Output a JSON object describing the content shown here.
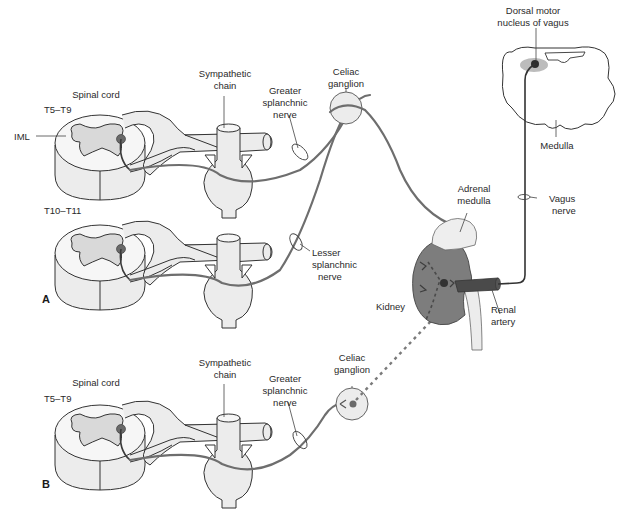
{
  "figure": {
    "panels": [
      {
        "id": "A",
        "label": "A",
        "spinal_segments": [
          {
            "title": "Spinal cord",
            "level": "T5–T9",
            "gray_matter_label": "IML",
            "chain_label": "Sympathetic chain",
            "nerve_label": "Greater splanchnic nerve"
          },
          {
            "level": "T10–T11",
            "nerve_label": "Lesser splanchnic nerve"
          }
        ],
        "ganglion_label": "Celiac ganglion"
      },
      {
        "id": "B",
        "label": "B",
        "spinal_segment": {
          "title": "Spinal cord",
          "level": "T5–T9",
          "chain_label": "Sympathetic chain",
          "nerve_label": "Greater splanchnic nerve"
        },
        "ganglion_label": "Celiac ganglion"
      }
    ],
    "organs": {
      "adrenal_label": "Adrenal medulla",
      "kidney_label": "Kidney",
      "artery_label": "Renal artery"
    },
    "brainstem": {
      "nucleus_label": "Dorsal motor nucleus of vagus",
      "medulla_label": "Medulla",
      "vagus_label": "Vagus nerve"
    },
    "labels": {
      "spinal_cord": "Spinal cord",
      "t5_t9": "T5–T9",
      "t10_t11": "T10–T11",
      "iml": "IML",
      "sympathetic_1": "Sympathetic",
      "sympathetic_2": "chain",
      "greater_1": "Greater",
      "greater_2": "splanchnic",
      "greater_3": "nerve",
      "lesser_1": "Lesser",
      "lesser_2": "splanchnic",
      "lesser_3": "nerve",
      "celiac_1": "Celiac",
      "celiac_2": "ganglion",
      "adrenal_1": "Adrenal",
      "adrenal_2": "medulla",
      "kidney": "Kidney",
      "renal_1": "Renal",
      "renal_2": "artery",
      "dorsal_1": "Dorsal motor",
      "dorsal_2": "nucleus of vagus",
      "medulla": "Medulla",
      "vagus_1": "Vagus",
      "vagus_2": "nerve",
      "panel_a": "A",
      "panel_b": "B"
    },
    "colors": {
      "nerve": "#6e6e6e",
      "tissue_light": "#ececec",
      "kidney": "#7d7d7d",
      "nucleus": "#3b3b3b",
      "background": "#ffffff"
    }
  }
}
